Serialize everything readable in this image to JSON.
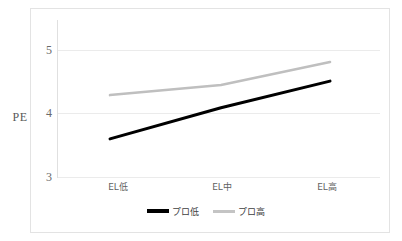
{
  "chart_data": {
    "type": "line",
    "title": "",
    "xlabel": "",
    "ylabel": "PE",
    "categories": [
      "EL低",
      "EL中",
      "EL高"
    ],
    "series": [
      {
        "name": "プロ低",
        "values": [
          3.6,
          4.09,
          4.51
        ],
        "color": "#000000"
      },
      {
        "name": "プロ高",
        "values": [
          4.29,
          4.45,
          4.81
        ],
        "color": "#bfbfbf"
      }
    ],
    "ylim": [
      3,
      5.2
    ],
    "yticks": [
      3,
      4,
      5
    ],
    "ytick_labels": [
      "3",
      "4",
      "5"
    ],
    "grid": true,
    "legend_position": "bottom"
  },
  "axis": {
    "y_title": "PE",
    "y_tick_3": "3",
    "y_tick_4": "4",
    "y_tick_5": "5",
    "x_tick_1": "EL低",
    "x_tick_2": "EL中",
    "x_tick_3": "EL高"
  },
  "legend": {
    "entry_1_label": "プロ低",
    "entry_2_label": "プロ高"
  },
  "colors": {
    "series_low": "#000000",
    "series_high": "#bfbfbf",
    "gridline": "#ebebeb",
    "frame": "#e3e3e3",
    "tick_text": "#6a6a6a"
  }
}
